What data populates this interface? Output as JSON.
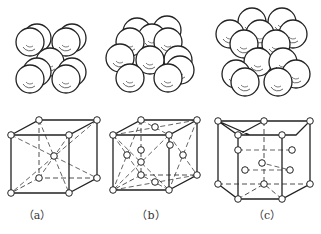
{
  "figure": {
    "panels": [
      {
        "id": "a",
        "caption": "（a）",
        "structure": "body-centered cubic"
      },
      {
        "id": "b",
        "caption": "（b）",
        "structure": "face-centered cubic"
      },
      {
        "id": "c",
        "caption": "（c）",
        "structure": "hexagonal close-packed"
      }
    ],
    "colors": {
      "line": "#222222",
      "background": "#ffffff"
    }
  }
}
